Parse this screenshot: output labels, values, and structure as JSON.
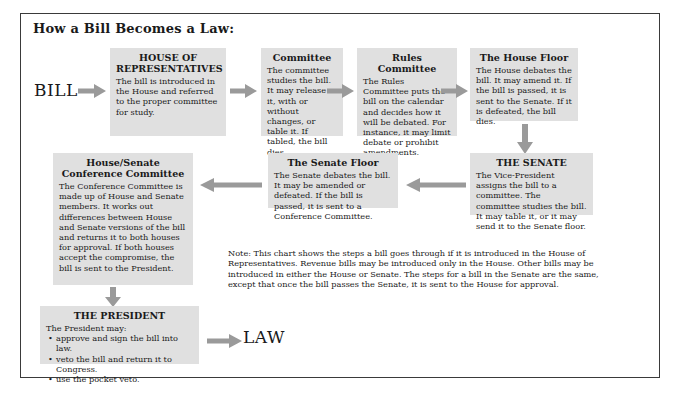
{
  "chart": {
    "title": "How a Bill Becomes a Law:",
    "start_label": "BILL",
    "end_label": "LAW",
    "frame_color": "#3a3a3a",
    "box_color": "#e0e0e0",
    "arrow_color": "#9a9a9a"
  },
  "nodes": {
    "house": {
      "title": "HOUSE OF REPRESENTATIVES",
      "body": "The bill is introduced in the House and referred to the proper committee for study."
    },
    "committee": {
      "title": "Committee",
      "body": "The committee studies the bill. It may release it, with or without changes, or table it. If tabled, the bill dies."
    },
    "rules": {
      "title": "Rules Committee",
      "body": "The Rules Committee puts the bill on the calendar and decides how it will be debated. For instance, it may limit debate or prohibit amendments."
    },
    "house_floor": {
      "title": "The House Floor",
      "body": "The House debates the bill. It may amend it. If the bill is passed, it is sent to the Senate. If it is defeated, the bill dies."
    },
    "senate": {
      "title": "THE SENATE",
      "body": "The Vice-President assigns the bill to a committee. The committee studies the bill. It may table it, or it may send it to the Senate floor."
    },
    "senate_floor": {
      "title": "The Senate Floor",
      "body": "The Senate debates the bill. It may be amended or defeated. If the bill is passed, it is sent to a Conference Committee."
    },
    "conference": {
      "title": "House/Senate Conference Committee",
      "body": "The Conference Committee is made up of House and Senate members. It works out differences between House and Senate versions of the bill and returns it to both houses for approval. If both houses accept the compromise, the bill is sent to the President."
    },
    "president": {
      "title": "THE PRESIDENT",
      "body": "The President may:",
      "options": [
        "approve and sign the bill into law.",
        "veto the bill and return it to Congress.",
        "use the pocket veto."
      ]
    }
  },
  "note": "Note: This chart shows the steps a bill goes through if it is introduced in the House of Representatives. Revenue bills may be introduced only in the House. Other bills may be introduced in either the House or Senate. The steps for a bill in the Senate are the same, except that once the bill passes the Senate, it is sent to the House for approval."
}
